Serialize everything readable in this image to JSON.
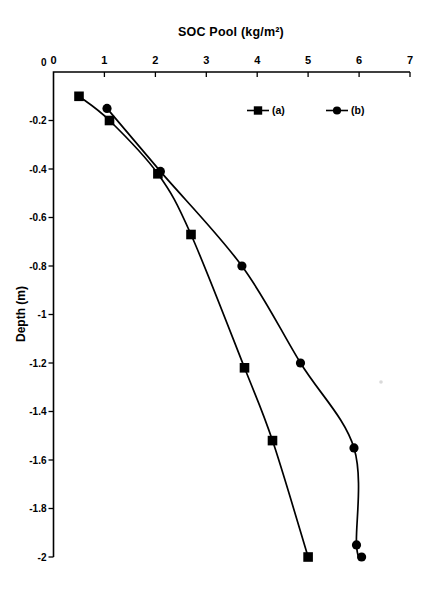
{
  "chart_data": {
    "type": "line",
    "title": "SOC Pool (kg/m²)",
    "ylabel": "Depth (m)",
    "xlim": [
      0,
      7
    ],
    "ylim": [
      -2,
      0
    ],
    "x_tick_labels": [
      "0",
      "1",
      "2",
      "3",
      "4",
      "5",
      "6",
      "7"
    ],
    "y_tick_labels": [
      "0",
      "-0.2",
      "-0.4",
      "-0.6",
      "-0.8",
      "-1",
      "-1.2",
      "-1.4",
      "-1.6",
      "-1.8",
      "-2"
    ],
    "grid": false,
    "legend_position": "inside-top",
    "axis_color": "#000000",
    "line_style": "smooth",
    "series": [
      {
        "name": "(a)",
        "marker": "square",
        "color": "#000000",
        "points": [
          [
            0.5,
            -0.1
          ],
          [
            1.1,
            -0.2
          ],
          [
            2.05,
            -0.42
          ],
          [
            2.7,
            -0.67
          ],
          [
            3.75,
            -1.22
          ],
          [
            4.3,
            -1.52
          ],
          [
            5.0,
            -2.0
          ]
        ]
      },
      {
        "name": "(b)",
        "marker": "circle",
        "color": "#000000",
        "points": [
          [
            1.05,
            -0.15
          ],
          [
            2.1,
            -0.41
          ],
          [
            3.7,
            -0.8
          ],
          [
            4.85,
            -1.2
          ],
          [
            5.9,
            -1.55
          ],
          [
            5.95,
            -1.95
          ],
          [
            6.05,
            -2.0
          ]
        ]
      }
    ]
  }
}
